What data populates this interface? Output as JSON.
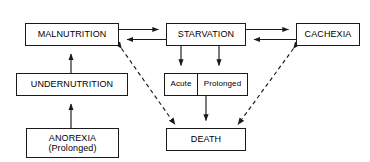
{
  "diagram": {
    "type": "flow-diagram",
    "stroke_color": "#1a1a1a",
    "background_color": "#ffffff",
    "nodes": [
      {
        "id": "malnutrition",
        "label": "MALNUTRITION"
      },
      {
        "id": "starvation",
        "label": "STARVATION"
      },
      {
        "id": "cachexia",
        "label": "CACHEXIA"
      },
      {
        "id": "undernutrition",
        "label": "UNDERNUTRITION"
      },
      {
        "id": "anorexia",
        "label": "ANOREXIA\n(Prolonged)"
      },
      {
        "id": "acute",
        "label": "Acute"
      },
      {
        "id": "prolonged",
        "label": "Prolonged"
      },
      {
        "id": "death",
        "label": "DEATH"
      }
    ],
    "edges": [
      {
        "from": "malnutrition",
        "to": "starvation",
        "style": "solid",
        "arrows": "forward"
      },
      {
        "from": "starvation",
        "to": "malnutrition",
        "style": "solid",
        "arrows": "forward"
      },
      {
        "from": "starvation",
        "to": "cachexia",
        "style": "solid",
        "arrows": "forward"
      },
      {
        "from": "cachexia",
        "to": "starvation",
        "style": "solid",
        "arrows": "forward"
      },
      {
        "from": "undernutrition",
        "to": "malnutrition",
        "style": "solid",
        "arrows": "forward"
      },
      {
        "from": "anorexia",
        "to": "undernutrition",
        "style": "solid",
        "arrows": "forward"
      },
      {
        "from": "starvation",
        "to": "acute",
        "style": "solid",
        "arrows": "forward"
      },
      {
        "from": "starvation",
        "to": "prolonged",
        "style": "solid",
        "arrows": "forward"
      },
      {
        "from": "prolonged",
        "to": "death",
        "style": "solid",
        "arrows": "forward"
      },
      {
        "from": "malnutrition",
        "to": "death",
        "style": "dashed",
        "arrows": "both"
      },
      {
        "from": "cachexia",
        "to": "death",
        "style": "dashed",
        "arrows": "both"
      }
    ]
  },
  "nodes": {
    "malnutrition": "MALNUTRITION",
    "starvation": "STARVATION",
    "cachexia": "CACHEXIA",
    "undernutrition": "UNDERNUTRITION",
    "anorexia_line1": "ANOREXIA",
    "anorexia_line2": "(Prolonged)",
    "acute": "Acute",
    "prolonged": "Prolonged",
    "death": "DEATH"
  }
}
